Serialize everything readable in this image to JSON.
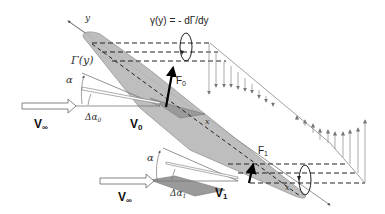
{
  "diagram": {
    "labels": {
      "y_axis": "y",
      "x_axis_mid": "x",
      "x_axis_tip": "x",
      "circulation": "Γ(y)",
      "vortex_strength": "γ(y) = - dΓ/dy",
      "force_root": "F",
      "force_root_sub": "0",
      "force_tip": "F",
      "force_tip_sub": "1",
      "alpha_root": "α",
      "alpha_tip": "α",
      "delta_alpha_root": "Δα",
      "delta_alpha_root_sub": "0",
      "delta_alpha_tip": "Δα",
      "delta_alpha_tip_sub": "1",
      "freestream_root": "V",
      "freestream_root_sub": "∞",
      "freestream_tip": "V",
      "freestream_tip_sub": "∞",
      "velocity_root": "V",
      "velocity_root_sub": "0",
      "velocity_tip": "V",
      "velocity_tip_sub": "1"
    },
    "colors": {
      "wing_fill": "#b8b8b8",
      "wing_stroke": "#8a8a8a",
      "line": "#555555",
      "dashed": "#222222",
      "arrows": "#777777",
      "force": "#000000"
    }
  }
}
